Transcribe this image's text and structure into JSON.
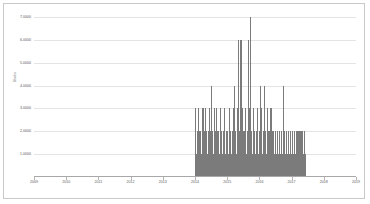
{
  "chart_data": {
    "type": "bar",
    "title": "",
    "xlabel": "",
    "ylabel": "Blocks",
    "ylim": [
      0,
      7
    ],
    "xlim": [
      2009,
      2019
    ],
    "grid": true,
    "legend": "none",
    "bar_color": "#7b7b7b",
    "yticks": [
      "1.0000",
      "2.0000",
      "3.0000",
      "4.0000",
      "5.0000",
      "6.0000",
      "7.0000"
    ],
    "ytick_values": [
      1,
      2,
      3,
      4,
      5,
      6,
      7
    ],
    "xticks": [
      "2009",
      "2010",
      "2011",
      "2012",
      "2013",
      "2014",
      "2015",
      "2016",
      "2017",
      "2018",
      "2019"
    ],
    "xtick_values": [
      2009,
      2010,
      2011,
      2012,
      2013,
      2014,
      2015,
      2016,
      2017,
      2018,
      2019
    ],
    "x": [
      2014.02,
      2014.05,
      2014.08,
      2014.1,
      2014.13,
      2014.15,
      2014.17,
      2014.2,
      2014.23,
      2014.25,
      2014.28,
      2014.3,
      2014.33,
      2014.36,
      2014.38,
      2014.41,
      2014.44,
      2014.46,
      2014.49,
      2014.52,
      2014.54,
      2014.57,
      2014.6,
      2014.62,
      2014.65,
      2014.68,
      2014.71,
      2014.74,
      2014.77,
      2014.8,
      2014.83,
      2014.86,
      2014.89,
      2014.92,
      2014.95,
      2014.98,
      2015.01,
      2015.04,
      2015.07,
      2015.1,
      2015.13,
      2015.16,
      2015.19,
      2015.22,
      2015.25,
      2015.28,
      2015.31,
      2015.34,
      2015.37,
      2015.4,
      2015.43,
      2015.46,
      2015.49,
      2015.52,
      2015.55,
      2015.58,
      2015.61,
      2015.64,
      2015.67,
      2015.7,
      2015.73,
      2015.76,
      2015.79,
      2015.82,
      2015.85,
      2015.88,
      2015.91,
      2015.94,
      2015.97,
      2016.0,
      2016.03,
      2016.06,
      2016.09,
      2016.12,
      2016.15,
      2016.18,
      2016.21,
      2016.24,
      2016.27,
      2016.3,
      2016.33,
      2016.36,
      2016.39,
      2016.42,
      2016.45,
      2016.48,
      2016.51,
      2016.54,
      2016.57,
      2016.6,
      2016.63,
      2016.66,
      2016.69,
      2016.72,
      2016.75,
      2016.78,
      2016.81,
      2016.84,
      2016.87,
      2016.9,
      2016.93,
      2016.96,
      2016.99,
      2017.02,
      2017.05,
      2017.08,
      2017.11,
      2017.14,
      2017.17,
      2017.2,
      2017.23,
      2017.26,
      2017.29,
      2017.32,
      2017.35,
      2017.38,
      2017.41,
      2017.44
    ],
    "values": [
      3,
      1,
      2,
      3,
      1,
      2,
      2,
      1,
      2,
      3,
      2,
      1,
      3,
      2,
      1,
      2,
      3,
      1,
      2,
      4,
      2,
      1,
      3,
      2,
      1,
      3,
      2,
      2,
      1,
      3,
      2,
      1,
      2,
      3,
      1,
      2,
      2,
      1,
      3,
      2,
      1,
      2,
      3,
      4,
      2,
      1,
      3,
      6,
      2,
      1,
      6,
      3,
      2,
      1,
      2,
      3,
      1,
      2,
      6,
      3,
      7,
      2,
      1,
      3,
      2,
      1,
      2,
      3,
      1,
      2,
      4,
      3,
      1,
      2,
      4,
      2,
      1,
      3,
      2,
      1,
      2,
      3,
      1,
      2,
      2,
      1,
      2,
      1,
      2,
      1,
      2,
      1,
      2,
      1,
      4,
      2,
      1,
      2,
      1,
      2,
      1,
      2,
      1,
      2,
      1,
      2,
      1,
      2,
      1,
      2,
      2,
      1,
      2,
      1,
      2,
      1,
      2,
      1
    ]
  }
}
